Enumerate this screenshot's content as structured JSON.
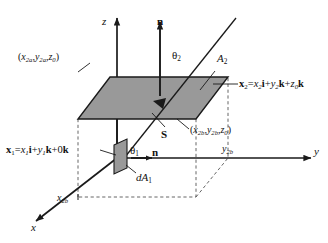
{
  "figure": {
    "colors": {
      "plane_fill": "#999999",
      "plane_stroke": "#1a1a1a",
      "axis": "#1a1a1a",
      "dashed": "#555555",
      "background": "#ffffff"
    }
  },
  "axes": {
    "z_label": "z",
    "y_label": "y",
    "x_label": "x",
    "tick_x2b": "x2b",
    "tick_y2b": "y2b"
  },
  "labels": {
    "normal_top": "n",
    "normal_bottom": "n",
    "theta2": "θ2",
    "theta1": "θ1",
    "area2": "A2",
    "vector_s": "S",
    "dA1": "dA1",
    "corner_2a": "(x2a,y2a,z0)",
    "corner_2b": "(x2b,y2b,z0)",
    "x2_equation": "x2=x2i+y2k+z0k",
    "x1_equation": "x1=x1i+y1k+0k"
  },
  "equations": {
    "x2": {
      "lhs_bold": "x",
      "lhs_sub": "2",
      "eq": "=",
      "t1_var": "x",
      "t1_sub": "2",
      "t1_unit": "i",
      "plus1": "+",
      "t2_var": "y",
      "t2_sub": "2",
      "t2_unit": "k",
      "plus2": "+",
      "t3_var": "z",
      "t3_sub": "0",
      "t3_unit": "k"
    },
    "x1": {
      "lhs_bold": "x",
      "lhs_sub": "1",
      "eq": "=",
      "t1_var": "x",
      "t1_sub": "1",
      "t1_unit": "i",
      "plus1": "+",
      "t2_var": "y",
      "t2_sub": "1",
      "t2_unit": "k",
      "plus2": "+",
      "t3_var": "0",
      "t3_sub": "",
      "t3_unit": "k"
    }
  },
  "points": {
    "corner_2a": {
      "open": "(",
      "x": "x",
      "xs": "2a",
      "c1": ",",
      "y": "y",
      "ys": "2a",
      "c2": ",",
      "z": "z",
      "zs": "0",
      "close": ")"
    },
    "corner_2b": {
      "open": "(",
      "x": "x",
      "xs": "2b",
      "c1": ",",
      "y": "y",
      "ys": "2b",
      "c2": ",",
      "z": "z",
      "zs": "0",
      "close": ")"
    }
  },
  "greek": {
    "theta": "θ",
    "sub2": "2",
    "sub1": "1"
  },
  "vars": {
    "x": "x",
    "y": "y",
    "z": "z",
    "A": "A",
    "d": "d",
    "sub2": "2",
    "sub1": "1",
    "sub2b": "2b",
    "n": "n",
    "S": "S"
  }
}
